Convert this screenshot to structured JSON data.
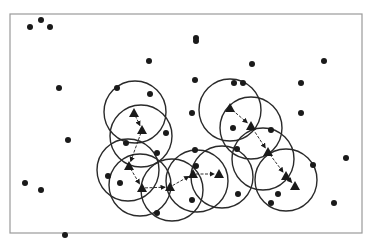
{
  "diagram": {
    "type": "sensor-coverage-network",
    "frame": {
      "x": 10,
      "y": 14,
      "width": 352,
      "height": 219,
      "stroke": "#9a9a9a"
    },
    "colors": {
      "ink": "#1a1a1a",
      "circle": "#2a2a2a",
      "background": "#ffffff"
    },
    "circle_radius": 31,
    "dots": [
      {
        "x": 30,
        "y": 27
      },
      {
        "x": 41,
        "y": 20
      },
      {
        "x": 50,
        "y": 27
      },
      {
        "x": 149,
        "y": 61
      },
      {
        "x": 59,
        "y": 88
      },
      {
        "x": 117,
        "y": 88
      },
      {
        "x": 150,
        "y": 94
      },
      {
        "x": 196,
        "y": 38
      },
      {
        "x": 196,
        "y": 41
      },
      {
        "x": 252,
        "y": 64
      },
      {
        "x": 324,
        "y": 61
      },
      {
        "x": 195,
        "y": 80
      },
      {
        "x": 234,
        "y": 83
      },
      {
        "x": 243,
        "y": 83
      },
      {
        "x": 301,
        "y": 83
      },
      {
        "x": 192,
        "y": 113
      },
      {
        "x": 301,
        "y": 113
      },
      {
        "x": 68,
        "y": 140
      },
      {
        "x": 166,
        "y": 133
      },
      {
        "x": 126,
        "y": 143
      },
      {
        "x": 157,
        "y": 153
      },
      {
        "x": 233,
        "y": 128
      },
      {
        "x": 271,
        "y": 130
      },
      {
        "x": 108,
        "y": 176
      },
      {
        "x": 120,
        "y": 183
      },
      {
        "x": 195,
        "y": 150
      },
      {
        "x": 196,
        "y": 166
      },
      {
        "x": 237,
        "y": 149
      },
      {
        "x": 313,
        "y": 165
      },
      {
        "x": 25,
        "y": 183
      },
      {
        "x": 41,
        "y": 190
      },
      {
        "x": 238,
        "y": 194
      },
      {
        "x": 278,
        "y": 194
      },
      {
        "x": 271,
        "y": 203
      },
      {
        "x": 157,
        "y": 213
      },
      {
        "x": 192,
        "y": 200
      },
      {
        "x": 346,
        "y": 158
      },
      {
        "x": 334,
        "y": 203
      },
      {
        "x": 65,
        "y": 235
      }
    ],
    "nodes": [
      {
        "id": "t1",
        "x": 134,
        "y": 113
      },
      {
        "id": "t2",
        "x": 142,
        "y": 130
      },
      {
        "id": "t3",
        "x": 129,
        "y": 166
      },
      {
        "id": "t4",
        "x": 142,
        "y": 188
      },
      {
        "id": "t5",
        "x": 170,
        "y": 187
      },
      {
        "id": "t6",
        "x": 193,
        "y": 174
      },
      {
        "id": "t7",
        "x": 219,
        "y": 174
      },
      {
        "id": "t8",
        "x": 230,
        "y": 108
      },
      {
        "id": "t9",
        "x": 251,
        "y": 126
      },
      {
        "id": "t10",
        "x": 268,
        "y": 152
      },
      {
        "id": "t11",
        "x": 286,
        "y": 176
      },
      {
        "id": "t12",
        "x": 295,
        "y": 186
      }
    ],
    "circles": [
      {
        "cx": 135,
        "cy": 112
      },
      {
        "cx": 141,
        "cy": 136
      },
      {
        "cx": 128,
        "cy": 170
      },
      {
        "cx": 140,
        "cy": 185
      },
      {
        "cx": 172,
        "cy": 190
      },
      {
        "cx": 197,
        "cy": 181
      },
      {
        "cx": 222,
        "cy": 177
      },
      {
        "cx": 230,
        "cy": 110
      },
      {
        "cx": 251,
        "cy": 128
      },
      {
        "cx": 263,
        "cy": 159
      },
      {
        "cx": 286,
        "cy": 180
      }
    ],
    "edges": [
      {
        "from": "t1",
        "to": "t2"
      },
      {
        "from": "t2",
        "to": "t3"
      },
      {
        "from": "t3",
        "to": "t4"
      },
      {
        "from": "t4",
        "to": "t5"
      },
      {
        "from": "t5",
        "to": "t6"
      },
      {
        "from": "t6",
        "to": "t7"
      },
      {
        "from": "t8",
        "to": "t9"
      },
      {
        "from": "t9",
        "to": "t10"
      },
      {
        "from": "t10",
        "to": "t11"
      },
      {
        "from": "t11",
        "to": "t12"
      }
    ]
  }
}
